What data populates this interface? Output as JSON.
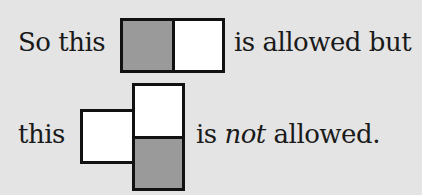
{
  "line1": {
    "prefix": "So this",
    "suffix": "is allowed but"
  },
  "line2": {
    "prefix": "this",
    "suffix_pre": "is ",
    "suffix_emph": "not",
    "suffix_post": " allowed."
  },
  "colors": {
    "background": "#e4e4e4",
    "shaded_cell": "#9a9a9a",
    "empty_cell": "#ffffff",
    "border": "#111111"
  }
}
